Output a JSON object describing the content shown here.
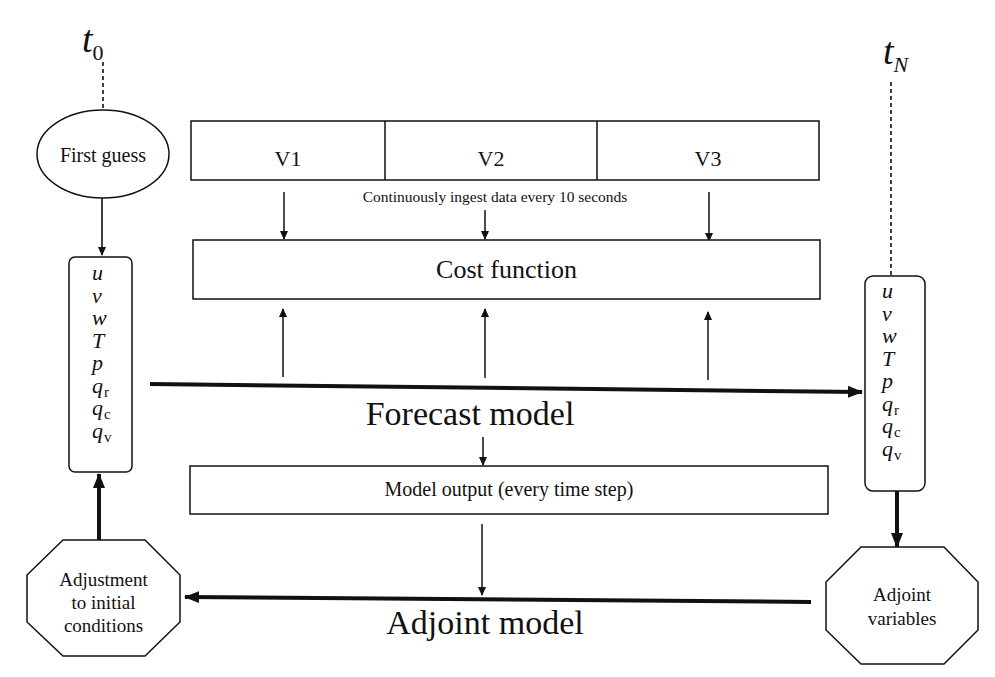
{
  "diagram": {
    "time_start": {
      "base": "t",
      "sub": "0"
    },
    "time_end": {
      "base": "t",
      "sub": "N"
    },
    "first_guess": "First guess",
    "state_vars_left": [
      {
        "base": "u",
        "sub": ""
      },
      {
        "base": "v",
        "sub": ""
      },
      {
        "base": "w",
        "sub": ""
      },
      {
        "base": "T",
        "sub": ""
      },
      {
        "base": "p",
        "sub": ""
      },
      {
        "base": "q",
        "sub": "r"
      },
      {
        "base": "q",
        "sub": "c"
      },
      {
        "base": "q",
        "sub": "v"
      }
    ],
    "state_vars_right": [
      {
        "base": "u",
        "sub": ""
      },
      {
        "base": "v",
        "sub": ""
      },
      {
        "base": "w",
        "sub": ""
      },
      {
        "base": "T",
        "sub": ""
      },
      {
        "base": "p",
        "sub": ""
      },
      {
        "base": "q",
        "sub": "r"
      },
      {
        "base": "q",
        "sub": "c"
      },
      {
        "base": "q",
        "sub": "v"
      }
    ],
    "observations": [
      "V1",
      "V2",
      "V3"
    ],
    "ingest_note": "Continuously ingest data every 10 seconds",
    "cost_function": "Cost function",
    "forecast_model": "Forecast model",
    "model_output": "Model output (every time step)",
    "adjoint_model": "Adjoint model",
    "adjustment": [
      "Adjustment",
      "to initial",
      "conditions"
    ],
    "adjoint_variables": [
      "Adjoint",
      "variables"
    ],
    "colors": {
      "stroke": "#111111",
      "background": "#ffffff"
    }
  }
}
